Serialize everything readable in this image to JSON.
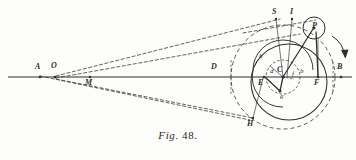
{
  "figure": {
    "caption_word": "Fig.",
    "caption_number": "48.",
    "title": "Fig. 48.",
    "background_color": "#fdfdfc",
    "ink_color": "#2e2e2c"
  },
  "labels": [
    {
      "key": "A",
      "text": "A",
      "x": 35,
      "y": 66,
      "style": "cap"
    },
    {
      "key": "O",
      "text": "O",
      "x": 51,
      "y": 65,
      "style": "cap"
    },
    {
      "key": "M",
      "text": "M",
      "x": 85,
      "y": 78,
      "style": "cap"
    },
    {
      "key": "D",
      "text": "D",
      "x": 211,
      "y": 66,
      "style": "cap"
    },
    {
      "key": "S",
      "text": "S",
      "x": 273,
      "y": 8,
      "style": "cap"
    },
    {
      "key": "I",
      "text": "I",
      "x": 291,
      "y": 8,
      "style": "cap"
    },
    {
      "key": "P",
      "text": "P",
      "x": 315,
      "y": 22,
      "style": "cap"
    },
    {
      "key": "h",
      "text": "h",
      "x": 259,
      "y": 54,
      "style": "low"
    },
    {
      "key": "d",
      "text": "d",
      "x": 271,
      "y": 70,
      "style": "low"
    },
    {
      "key": "C",
      "text": "C",
      "x": 279,
      "y": 68,
      "style": "cap"
    },
    {
      "key": "f",
      "text": "f",
      "x": 292,
      "y": 73,
      "style": "low"
    },
    {
      "key": "b",
      "text": "b",
      "x": 300,
      "y": 70,
      "style": "low"
    },
    {
      "key": "E",
      "text": "E",
      "x": 259,
      "y": 79,
      "style": "cap"
    },
    {
      "key": "g",
      "text": "g",
      "x": 281,
      "y": 93,
      "style": "low"
    },
    {
      "key": "F",
      "text": "F",
      "x": 315,
      "y": 79,
      "style": "cap"
    },
    {
      "key": "B",
      "text": "B",
      "x": 338,
      "y": 66,
      "style": "cap"
    },
    {
      "key": "H",
      "text": "H",
      "x": 248,
      "y": 124,
      "style": "cap"
    }
  ],
  "geometry": {
    "axis": {
      "name": "horizontal-axis",
      "x1": 8,
      "y1": 77,
      "x2": 352,
      "y2": 77
    },
    "points": {
      "A": [
        40,
        77
      ],
      "O": [
        55,
        77
      ],
      "M": [
        90,
        77
      ],
      "D": [
        218,
        77
      ],
      "C": [
        283,
        77
      ],
      "E": [
        264,
        77
      ],
      "F": [
        318,
        77
      ],
      "B": [
        341,
        77
      ],
      "S": [
        276,
        19
      ],
      "I": [
        292,
        19
      ],
      "P": [
        314,
        28
      ],
      "g": [
        280,
        91
      ],
      "H": [
        253,
        118
      ],
      "h": [
        265,
        58
      ]
    },
    "circles": [
      {
        "name": "large-solid-circle",
        "cx": 289,
        "cy": 82,
        "r": 38,
        "dash": "solid"
      },
      {
        "name": "large-dashed-circle",
        "cx": 283,
        "cy": 77,
        "r": 52,
        "dash": "dashed"
      },
      {
        "name": "inner-dashed-circle",
        "cx": 283,
        "cy": 77,
        "r": 17,
        "dash": "dashed"
      },
      {
        "name": "small-pin-circle",
        "cx": 314,
        "cy": 28,
        "r": 11,
        "dash": "solid"
      }
    ]
  },
  "annotations": {
    "rotation_arrow": "clockwise-rotation-arrow"
  }
}
